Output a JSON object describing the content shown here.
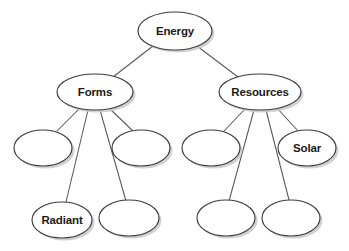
{
  "diagram": {
    "type": "concept-map",
    "background_color": "#ffffff",
    "node_fill_color": "#ffffff",
    "node_stroke_color": "#3c3c3e",
    "edge_color": "#58585a",
    "label_color": "#1a1a1a",
    "shadow_color": "#c9c9cc",
    "nodes": [
      {
        "id": "energy",
        "label": "Energy",
        "cx": 175,
        "cy": 31,
        "rx": 37,
        "ry": 19,
        "level": 0,
        "filled": true
      },
      {
        "id": "forms",
        "label": "Forms",
        "cx": 95,
        "cy": 92,
        "rx": 38,
        "ry": 18,
        "level": 1,
        "filled": true
      },
      {
        "id": "resources",
        "label": "Resources",
        "cx": 260,
        "cy": 92,
        "rx": 41,
        "ry": 18,
        "level": 1,
        "filled": true
      },
      {
        "id": "forms-child-1",
        "label": "",
        "cx": 43,
        "cy": 148,
        "rx": 29,
        "ry": 18,
        "level": 2,
        "filled": false
      },
      {
        "id": "forms-child-2",
        "label": "",
        "cx": 141,
        "cy": 148,
        "rx": 29,
        "ry": 18,
        "level": 2,
        "filled": false
      },
      {
        "id": "forms-child-3",
        "label": "Radiant",
        "cx": 62,
        "cy": 220,
        "rx": 30,
        "ry": 18,
        "level": 3,
        "filled": true
      },
      {
        "id": "forms-child-4",
        "label": "",
        "cx": 129,
        "cy": 218,
        "rx": 30,
        "ry": 18,
        "level": 3,
        "filled": false
      },
      {
        "id": "resources-child-1",
        "label": "",
        "cx": 211,
        "cy": 148,
        "rx": 29,
        "ry": 18,
        "level": 2,
        "filled": false
      },
      {
        "id": "resources-child-2",
        "label": "Solar",
        "cx": 307,
        "cy": 148,
        "rx": 29,
        "ry": 18,
        "level": 2,
        "filled": true
      },
      {
        "id": "resources-child-3",
        "label": "",
        "cx": 226,
        "cy": 218,
        "rx": 29,
        "ry": 18,
        "level": 3,
        "filled": false
      },
      {
        "id": "resources-child-4",
        "label": "",
        "cx": 291,
        "cy": 218,
        "rx": 29,
        "ry": 18,
        "level": 3,
        "filled": false
      }
    ],
    "edges": [
      {
        "from": "energy",
        "to": "forms",
        "x1": 153,
        "y1": 46,
        "x2": 113,
        "y2": 77
      },
      {
        "from": "energy",
        "to": "resources",
        "x1": 197,
        "y1": 46,
        "x2": 238,
        "y2": 77
      },
      {
        "from": "forms",
        "to": "forms-child-1",
        "x1": 79,
        "y1": 109,
        "x2": 57,
        "y2": 131
      },
      {
        "from": "forms",
        "to": "forms-child-2",
        "x1": 110,
        "y1": 109,
        "x2": 133,
        "y2": 131
      },
      {
        "from": "forms",
        "to": "forms-child-3",
        "x1": 88,
        "y1": 110,
        "x2": 66,
        "y2": 202
      },
      {
        "from": "forms",
        "to": "forms-child-4",
        "x1": 100,
        "y1": 110,
        "x2": 126,
        "y2": 201
      },
      {
        "from": "resources",
        "to": "resources-child-1",
        "x1": 245,
        "y1": 109,
        "x2": 224,
        "y2": 131
      },
      {
        "from": "resources",
        "to": "resources-child-2",
        "x1": 277,
        "y1": 108,
        "x2": 298,
        "y2": 131
      },
      {
        "from": "resources",
        "to": "resources-child-3",
        "x1": 254,
        "y1": 110,
        "x2": 229,
        "y2": 201
      },
      {
        "from": "resources",
        "to": "resources-child-4",
        "x1": 266,
        "y1": 110,
        "x2": 289,
        "y2": 200
      }
    ]
  }
}
